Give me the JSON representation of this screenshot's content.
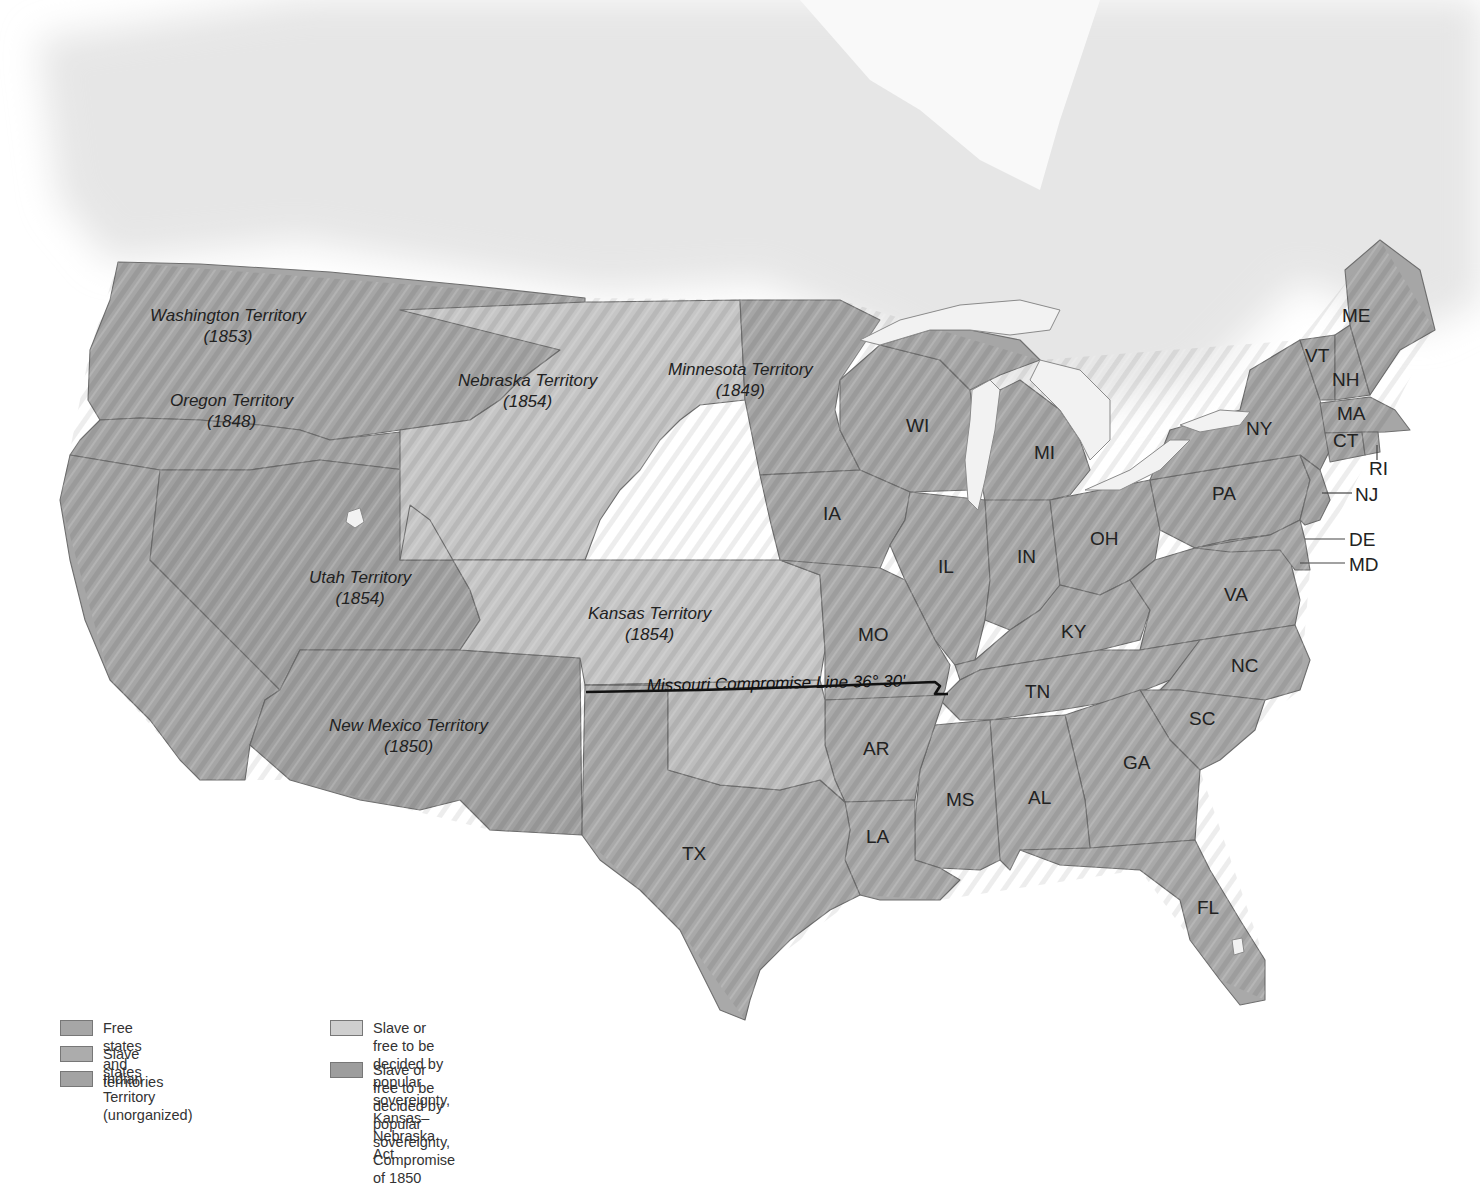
{
  "map": {
    "territories": [
      {
        "name": "Washington Territory",
        "year": "(1853)"
      },
      {
        "name": "Oregon Territory",
        "year": "(1848)"
      },
      {
        "name": "Nebraska Territory",
        "year": "(1854)"
      },
      {
        "name": "Minnesota Territory",
        "year": "(1849)"
      },
      {
        "name": "Utah Territory",
        "year": "(1854)"
      },
      {
        "name": "Kansas Territory",
        "year": "(1854)"
      },
      {
        "name": "New Mexico Territory",
        "year": "(1850)"
      }
    ],
    "states": {
      "ME": "ME",
      "VT": "VT",
      "NH": "NH",
      "MA": "MA",
      "CT": "CT",
      "RI": "RI",
      "NY": "NY",
      "NJ": "NJ",
      "PA": "PA",
      "DE": "DE",
      "MD": "MD",
      "WI": "WI",
      "MI": "MI",
      "IA": "IA",
      "IL": "IL",
      "IN": "IN",
      "OH": "OH",
      "MO": "MO",
      "KY": "KY",
      "VA": "VA",
      "NC": "NC",
      "TN": "TN",
      "SC": "SC",
      "GA": "GA",
      "AR": "AR",
      "MS": "MS",
      "AL": "AL",
      "LA": "LA",
      "TX": "TX",
      "FL": "FL"
    },
    "missouri_compromise_line": "Missouri Compromise Line 36° 30′",
    "colors": {
      "free": "#a6a6a6",
      "slave": "#a9a9a9",
      "indian_territory": "#bdbdbd",
      "kansas_nebraska": "#c6c6c6",
      "compromise_1850": "#a0a0a0",
      "background": "#ffffff",
      "canada": "#e6e6e6"
    }
  },
  "legend": {
    "items": [
      {
        "key": "free",
        "lines": [
          "Free states and territories"
        ]
      },
      {
        "key": "slave",
        "lines": [
          "Slave states"
        ]
      },
      {
        "key": "indian",
        "lines": [
          "Indian Territory (unorganized)"
        ]
      },
      {
        "key": "kn",
        "lines": [
          "Slave or free to be decided by popular",
          "sovereignty, Kansas–Nebraska Act"
        ]
      },
      {
        "key": "c1850",
        "lines": [
          "Slave or free to be decided by popular",
          "sovereignty, Compromise of 1850"
        ]
      }
    ]
  }
}
